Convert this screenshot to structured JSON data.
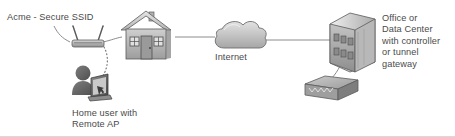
{
  "diagram": {
    "background_color": "#ffffff",
    "labels": {
      "ssid": "Acme - Secure SSID",
      "internet": "Internet",
      "home_user": "Home user with\nRemote AP",
      "datacenter": "Office or\nData Center\nwith controller\nor tunnel\ngateway"
    },
    "nodes": [
      {
        "id": "access-point",
        "icon": "wireless-access-point-icon",
        "label_ref": "ssid"
      },
      {
        "id": "house",
        "icon": "house-icon",
        "label_ref": ""
      },
      {
        "id": "user-laptop",
        "icon": "user-with-laptop-icon",
        "label_ref": "home_user"
      },
      {
        "id": "internet-cloud",
        "icon": "cloud-icon",
        "label_ref": "internet"
      },
      {
        "id": "office-building",
        "icon": "building-icon",
        "label_ref": "datacenter"
      },
      {
        "id": "gateway-appliance",
        "icon": "network-switch-icon",
        "label_ref": ""
      }
    ],
    "links": [
      {
        "from": "ssid-label",
        "to": "access-point",
        "style": "solid-leader"
      },
      {
        "from": "access-point",
        "to": "house",
        "style": "solid"
      },
      {
        "from": "access-point",
        "to": "user-laptop",
        "style": "dotted-wireless"
      },
      {
        "from": "house",
        "to": "internet-cloud",
        "style": "solid"
      },
      {
        "from": "internet-cloud",
        "to": "office-building",
        "style": "solid"
      },
      {
        "from": "office-building",
        "to": "gateway-appliance",
        "style": "solid"
      }
    ],
    "colors": {
      "text": "#4a4a4a",
      "line": "#8c8c8c",
      "icon_light": "#d2d2d2",
      "icon_mid": "#a8a8a8",
      "icon_dark": "#6e6e6e",
      "icon_darkest": "#4b4b4b",
      "outline": "#5a5a5a"
    }
  }
}
